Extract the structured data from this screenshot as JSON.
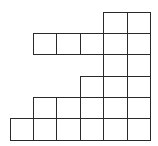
{
  "figure": {
    "stroke_color": "#2a2a2a",
    "fill_color": "#ffffff",
    "col_edges": [
      10,
      33,
      56,
      80,
      103,
      127,
      150
    ],
    "row_edges": [
      12,
      33,
      54,
      76,
      97,
      118,
      140
    ],
    "rows": [
      {
        "row": 0,
        "cols": [
          4,
          5
        ]
      },
      {
        "row": 1,
        "cols": [
          1,
          2,
          3,
          4,
          5
        ]
      },
      {
        "row": 2,
        "cols": [
          4,
          5
        ]
      },
      {
        "row": 3,
        "cols": [
          3,
          4,
          5
        ]
      },
      {
        "row": 4,
        "cols": [
          1,
          2,
          3,
          4,
          5
        ]
      },
      {
        "row": 5,
        "cols": [
          0,
          1,
          2,
          3,
          4,
          5
        ]
      }
    ],
    "cell_count": 23
  }
}
